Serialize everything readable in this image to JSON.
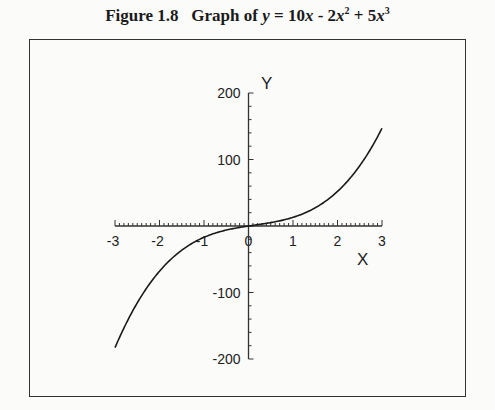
{
  "figure": {
    "number_label": "Figure 1.8",
    "caption_prefix": "Graph of ",
    "equation": {
      "var": "y",
      "eq": " = 10",
      "t1_var": "x",
      "t2": " - 2",
      "t2_var": "x",
      "t2_exp": "2",
      "t3": " + 5",
      "t3_var": "x",
      "t3_exp": "3"
    }
  },
  "axes": {
    "x_label": "X",
    "y_label": "Y",
    "x_ticks": [
      "-3",
      "-2",
      "-1",
      "0",
      "1",
      "2",
      "3"
    ],
    "y_ticks": [
      "200",
      "100",
      "-100",
      "-200"
    ]
  },
  "style": {
    "line_color": "#1a1a1a",
    "axis_color": "#333333",
    "background": "#fbfbfa"
  },
  "chart_data": {
    "type": "line",
    "xlabel": "X",
    "ylabel": "Y",
    "xlim": [
      -3,
      3
    ],
    "ylim": [
      -200,
      200
    ],
    "x_tick_labels": [
      "-3",
      "-2",
      "-1",
      "0",
      "1",
      "2",
      "3"
    ],
    "y_tick_labels": [
      "-200",
      "-100",
      "100",
      "200"
    ],
    "grid": false,
    "legend": null,
    "function": "y = 10x - 2x^2 + 5x^3",
    "series": [
      {
        "name": "y = 10x - 2x^2 + 5x^3",
        "x": [
          -3,
          -2.5,
          -2,
          -1.5,
          -1,
          -0.5,
          0,
          0.5,
          1,
          1.5,
          2,
          2.5,
          3
        ],
        "y": [
          -183,
          -115.6,
          -68,
          -36.4,
          -17,
          -6.1,
          0,
          4.1,
          13,
          27.4,
          52,
          90.6,
          147
        ]
      }
    ]
  }
}
